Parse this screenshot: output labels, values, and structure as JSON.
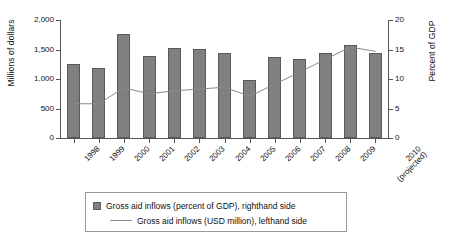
{
  "chart_data": {
    "type": "bar",
    "title": "",
    "xlabel": "",
    "ylabel": "Millions of dollars",
    "y2label": "Percent of GDP",
    "grid": false,
    "legend_position": "bottom",
    "categories": [
      "1998",
      "1999",
      "2000",
      "2001",
      "2002",
      "2003",
      "2004",
      "2005",
      "2006",
      "2007",
      "2008",
      "2009",
      "2010"
    ],
    "category_sublabels": [
      "",
      "",
      "",
      "",
      "",
      "",
      "",
      "",
      "",
      "",
      "",
      "",
      "(projected)"
    ],
    "ylim": [
      0,
      2000
    ],
    "yticks": [
      0,
      500,
      1000,
      1500,
      2000
    ],
    "ytick_labels": [
      "0",
      "500",
      "1,000",
      "1,500",
      "2,000"
    ],
    "y2lim": [
      0,
      20
    ],
    "y2ticks": [
      0,
      5,
      10,
      15,
      20
    ],
    "y2tick_labels": [
      "0",
      "5",
      "10",
      "15",
      "20"
    ],
    "series": [
      {
        "name": "Gross aid inflows (USD million), lefthand side",
        "type": "bar",
        "axis": "left",
        "color": "#808080",
        "values": [
          1255,
          1195,
          1760,
          1385,
          1525,
          1510,
          1440,
          990,
          1370,
          1335,
          1440,
          1570,
          1440
        ]
      },
      {
        "name": "Gross aid inflows (percent of GDP), righthand side",
        "type": "line",
        "axis": "right",
        "color": "#8a8a8a",
        "values": [
          5.8,
          5.8,
          8.5,
          7.5,
          8.0,
          8.3,
          8.6,
          7.1,
          9.1,
          11.2,
          13.3,
          15.4,
          14.7
        ]
      }
    ],
    "legend": [
      {
        "marker": "square",
        "label": "Gross aid inflows (percent of GDP), righthand side"
      },
      {
        "marker": "line",
        "label": "Gross aid inflows (USD million), lefthand side"
      }
    ]
  }
}
